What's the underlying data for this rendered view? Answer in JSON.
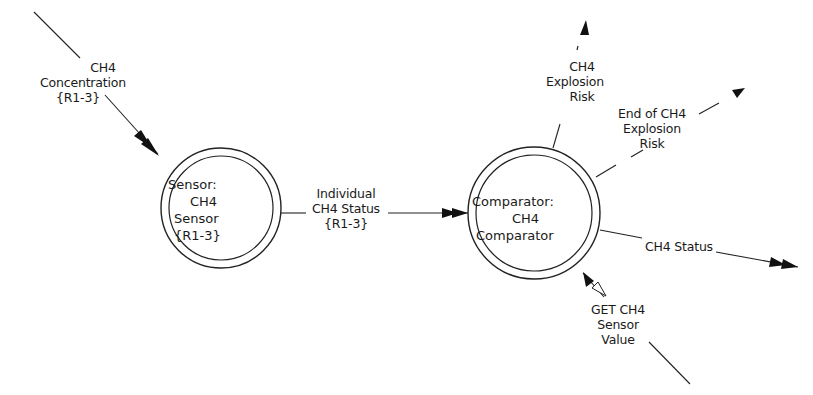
{
  "diagram": {
    "type": "data-flow-diagram",
    "processes": [
      {
        "id": "sensor",
        "lines": [
          "Sensor:",
          "CH4",
          "Sensor",
          "{R1-3}"
        ]
      },
      {
        "id": "comparator",
        "lines": [
          "Comparator:",
          "CH4",
          "Comparator"
        ]
      }
    ],
    "flows": [
      {
        "id": "ch4-concentration",
        "lines": [
          "CH4",
          "Concentration",
          "{R1-3}"
        ],
        "style": "solid",
        "from": "external",
        "to": "sensor"
      },
      {
        "id": "individual-ch4-status",
        "lines": [
          "Individual",
          "CH4 Status",
          "{R1-3}"
        ],
        "style": "solid",
        "from": "sensor",
        "to": "comparator"
      },
      {
        "id": "ch4-explosion-risk",
        "lines": [
          "CH4",
          "Explosion",
          "Risk"
        ],
        "style": "dashed",
        "from": "comparator",
        "to": "external"
      },
      {
        "id": "end-of-ch4-explosion-risk",
        "lines": [
          "End of CH4",
          "Explosion",
          "Risk"
        ],
        "style": "dashed",
        "from": "comparator",
        "to": "external"
      },
      {
        "id": "ch4-status",
        "lines": [
          "CH4 Status"
        ],
        "style": "solid",
        "from": "comparator",
        "to": "external"
      },
      {
        "id": "get-ch4-sensor-value",
        "lines": [
          "GET CH4",
          "Sensor",
          "Value"
        ],
        "style": "solid",
        "from": "external",
        "to": "comparator",
        "bidirectional": true
      }
    ]
  }
}
